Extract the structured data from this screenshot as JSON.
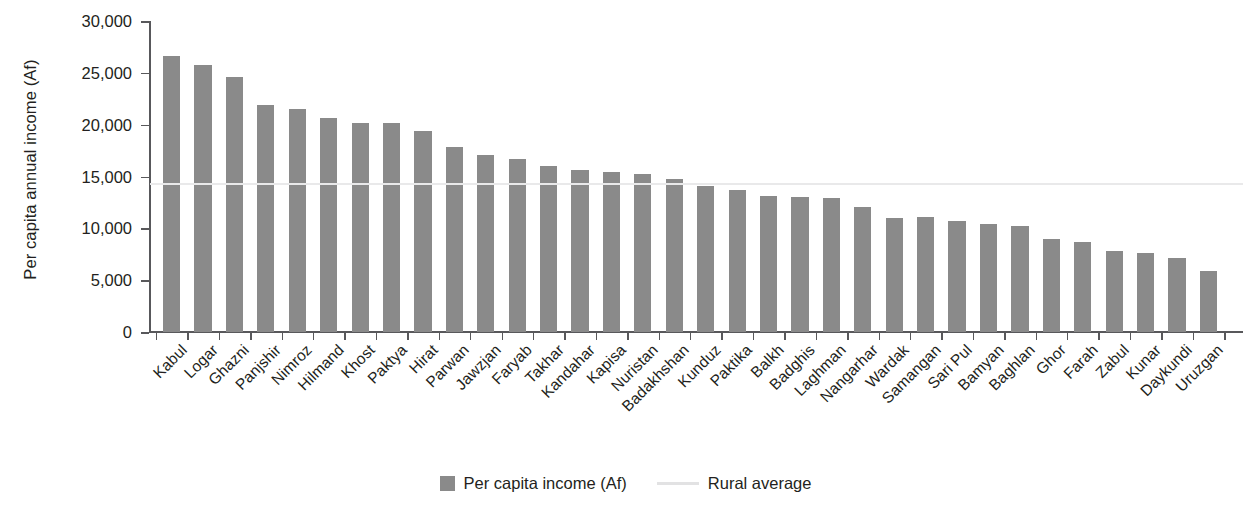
{
  "chart_data": {
    "type": "bar",
    "title": "",
    "xlabel": "",
    "ylabel": "Per capita annual income (Af)",
    "ylim": [
      0,
      30000
    ],
    "ytick_values": [
      0,
      5000,
      10000,
      15000,
      20000,
      25000,
      30000
    ],
    "ytick_labels": [
      "0",
      "5,000",
      "10,000",
      "15,000",
      "20,000",
      "25,000",
      "30,000"
    ],
    "grid": false,
    "legend_position": "bottom-center",
    "bar_color": "#8a8a8a",
    "reference_line_color": "#e9e9ea",
    "categories": [
      "Kabul",
      "Logar",
      "Ghazni",
      "Panjshir",
      "Nimroz",
      "Hilmand",
      "Khost",
      "Paktya",
      "Hirat",
      "Parwan",
      "Jawzjan",
      "Faryab",
      "Takhar",
      "Kandahar",
      "Kapisa",
      "Nuristan",
      "Badakhshan",
      "Kunduz",
      "Paktika",
      "Balkh",
      "Badghis",
      "Laghman",
      "Nangarhar",
      "Wardak",
      "Samangan",
      "Sari Pul",
      "Bamyan",
      "Baghlan",
      "Ghor",
      "Farah",
      "Zabul",
      "Kunar",
      "Daykundi",
      "Uruzgan"
    ],
    "series": [
      {
        "name": "Per capita income (Af)",
        "values": [
          26600,
          25800,
          24600,
          21900,
          21500,
          20600,
          20200,
          20150,
          19400,
          17800,
          17100,
          16700,
          16000,
          15600,
          15400,
          15200,
          14800,
          14100,
          13700,
          13100,
          13050,
          12900,
          12100,
          11000,
          11050,
          10750,
          10400,
          10200,
          9000,
          8650,
          7800,
          7600,
          7100,
          5900
        ]
      }
    ],
    "reference_line": {
      "name": "Rural average",
      "value": 14400
    },
    "legend": [
      {
        "label": "Per capita income (Af)",
        "marker": "square-swatch"
      },
      {
        "label": "Rural average",
        "marker": "line-swatch"
      }
    ]
  }
}
